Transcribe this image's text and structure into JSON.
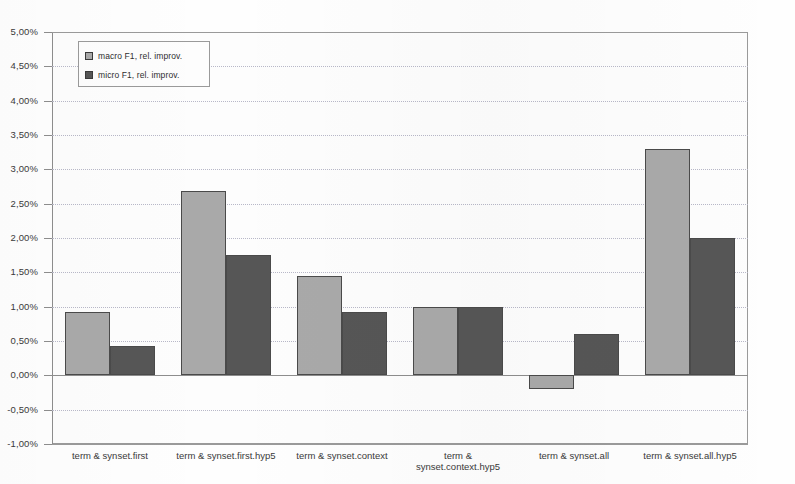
{
  "chart_data": {
    "type": "bar",
    "title": "",
    "xlabel": "",
    "ylabel": "",
    "ylim": [
      -1.0,
      5.0
    ],
    "ytick_step": 0.5,
    "grid": true,
    "legend_position": "top-left",
    "decimal_separator": ",",
    "value_suffix": "%",
    "categories": [
      "term & synset.first",
      "term & synset.first.hyp5",
      "term & synset.context",
      "term &\nsynset.context.hyp5",
      "term & synset.all",
      "term & synset.all.hyp5"
    ],
    "ytick_labels": [
      "5,00%",
      "4,50%",
      "4,00%",
      "3,50%",
      "3,00%",
      "2,50%",
      "2,00%",
      "1,50%",
      "1,00%",
      "0,50%",
      "0,00%",
      "-0,50%",
      "-1,00%"
    ],
    "ytick_values": [
      5.0,
      4.5,
      4.0,
      3.5,
      3.0,
      2.5,
      2.0,
      1.5,
      1.0,
      0.5,
      0.0,
      -0.5,
      -1.0
    ],
    "series": [
      {
        "name": "macro F1, rel. improv.",
        "color": "#a9a9a9",
        "values": [
          0.92,
          2.68,
          1.45,
          1.0,
          -0.2,
          3.3
        ]
      },
      {
        "name": "micro F1, rel. improv.",
        "color": "#565656",
        "values": [
          0.43,
          1.75,
          0.92,
          1.0,
          0.6,
          2.0
        ]
      }
    ]
  },
  "legend": {
    "items": [
      {
        "label": "macro F1, rel. improv."
      },
      {
        "label": "micro F1, rel. improv."
      }
    ]
  },
  "colors": {
    "macro": "#a9a9a9",
    "micro": "#565656",
    "axis": "#8d8d8d",
    "grid": "#b8b8c8",
    "background": "#fdfdfd"
  }
}
